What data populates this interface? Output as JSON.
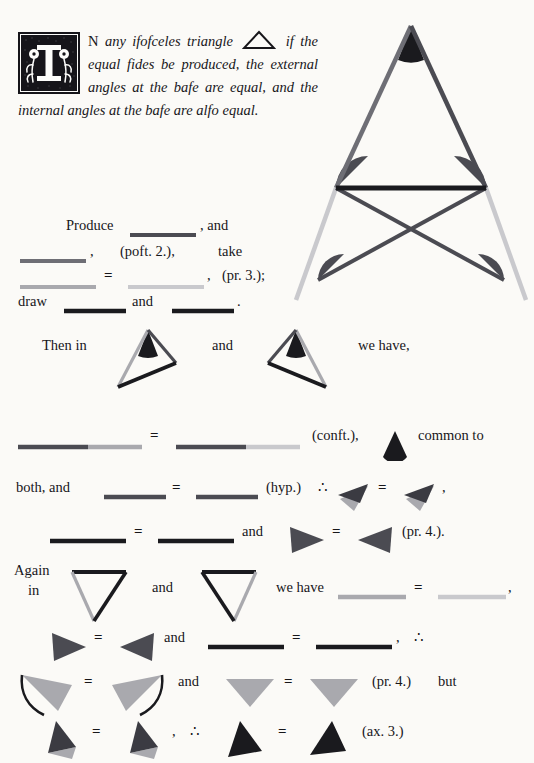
{
  "document": {
    "title": "Euclid's Elements — Book I, Proposition V (Byrne edition)",
    "dropcap_letter": "I"
  },
  "colors": {
    "ink": "#17161a",
    "black": "#1a1a1e",
    "dark_gray": "#4b4b52",
    "mid_gray": "#6e6e75",
    "light_gray": "#a9a9ae",
    "pale_gray": "#c9c9cd",
    "paper": "#fbfaf7"
  },
  "enunciation": {
    "lead_small_caps": "N",
    "line1": "any ifofceles triangle",
    "triangle_icon": "triangle-outline-icon",
    "line2": "if the equal fides",
    "line3": "be produced, the external",
    "line4": "angles at the bafe are equal, and the",
    "line5": "internal angles at the bafe are alfo",
    "line6": "equal."
  },
  "main_figure": {
    "name": "isosceles-triangle-with-produced-sides",
    "apex_angle_color": "#1a1a1e",
    "left_side_color": "#6e6e75",
    "right_side_color": "#4b4b52",
    "base_color": "#1a1a1e",
    "base_angle_left_color": "#4b4b52",
    "base_angle_right_color": "#4b4b52",
    "lower_left_angle_color": "#4b4b52",
    "lower_right_angle_color": "#4b4b52",
    "cross_line_a_color": "#4b4b52",
    "cross_line_b_color": "#4b4b52",
    "produced_left_color": "#c9c9cd",
    "produced_right_color": "#c9c9cd"
  },
  "construction": {
    "l1_a": "Produce",
    "l1_b": ", and",
    "l2_a": ",",
    "l2_b": "(poft. 2.),",
    "l2_c": "take",
    "l3_a": ",",
    "l3_b": "(pr. 3.);",
    "l4_a": "draw",
    "l4_b": "and",
    "l4_c": "."
  },
  "proof": {
    "then_in": "Then in",
    "and_1": "and",
    "we_have_1": "we have,",
    "const_ref": "(conft.),",
    "common_to": "common to",
    "both_and": "both, and",
    "hyp_ref": "(hyp.)",
    "therefore_1": "∴",
    "comma_1": ",",
    "and_2": "and",
    "pr4_ref_1": "(pr. 4.).",
    "again": "Again",
    "in": "in",
    "and_3": "and",
    "we_have_2": "we have",
    "comma_2": ",",
    "and_4": "and",
    "comma_3": ",",
    "therefore_2": "∴",
    "and_5": "and",
    "pr4_ref_2": "(pr. 4.)",
    "but": "but",
    "comma_4": ",",
    "therefore_3": "∴",
    "ax3_ref": "(ax. 3.)",
    "equals_sign": "="
  }
}
